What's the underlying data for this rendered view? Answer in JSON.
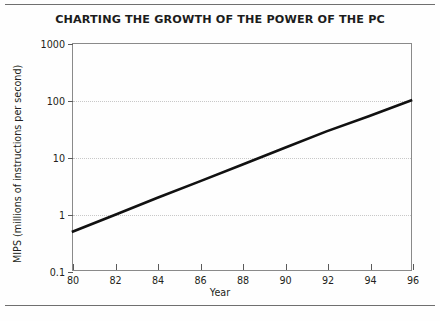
{
  "chart_data": {
    "type": "line",
    "title": "CHARTING THE GROWTH OF THE POWER OF THE PC",
    "xlabel": "Year",
    "ylabel": "MIPS (millions of instructions per second)",
    "yscale": "log",
    "xlim": [
      80,
      96
    ],
    "ylim": [
      0.1,
      1000
    ],
    "xticks": [
      80,
      82,
      84,
      86,
      88,
      90,
      92,
      94,
      96
    ],
    "xtick_labels": [
      "80",
      "82",
      "84",
      "86",
      "88",
      "90",
      "92",
      "94",
      "96"
    ],
    "yticks": [
      0.1,
      1,
      10,
      100,
      1000
    ],
    "ytick_labels": [
      "0.1",
      "1",
      "10",
      "100",
      "1000"
    ],
    "grid": "horizontal-dotted",
    "legend": null,
    "series": [
      {
        "name": "PC processing power",
        "x": [
          80,
          96
        ],
        "values": [
          0.48,
          100
        ],
        "points": [
          {
            "x": 80,
            "y": 0.48
          },
          {
            "x": 82,
            "y": 0.95
          },
          {
            "x": 84,
            "y": 1.9
          },
          {
            "x": 86,
            "y": 3.7
          },
          {
            "x": 88,
            "y": 7.3
          },
          {
            "x": 90,
            "y": 14.4
          },
          {
            "x": 92,
            "y": 28.4
          },
          {
            "x": 94,
            "y": 52.5
          },
          {
            "x": 96,
            "y": 100
          }
        ],
        "color": "#111111",
        "line_width": 2.6,
        "style": "solid"
      }
    ],
    "annotations": [],
    "colors": {
      "axis": "#8a8a8a",
      "grid": "#c8c8c8",
      "text": "#231f20",
      "line": "#111111",
      "background": "#fefefe",
      "page_rule": "#6f6f6f"
    }
  }
}
